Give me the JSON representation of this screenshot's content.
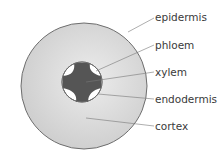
{
  "diagram": {
    "labels": [
      {
        "id": "epidermis",
        "text": "epidermis"
      },
      {
        "id": "phloem",
        "text": "phloem"
      },
      {
        "id": "xylem",
        "text": "xylem"
      },
      {
        "id": "endodermis",
        "text": "endodermis"
      },
      {
        "id": "cortex",
        "text": "cortex"
      }
    ],
    "colors": {
      "cortex_fill": "#d6d6d6",
      "outline": "#6e6e6e",
      "xylem_fill": "#555555",
      "phloem_fill": "#ffffff",
      "leader_line": "#777777",
      "label_text": "#3a3a3a"
    }
  }
}
